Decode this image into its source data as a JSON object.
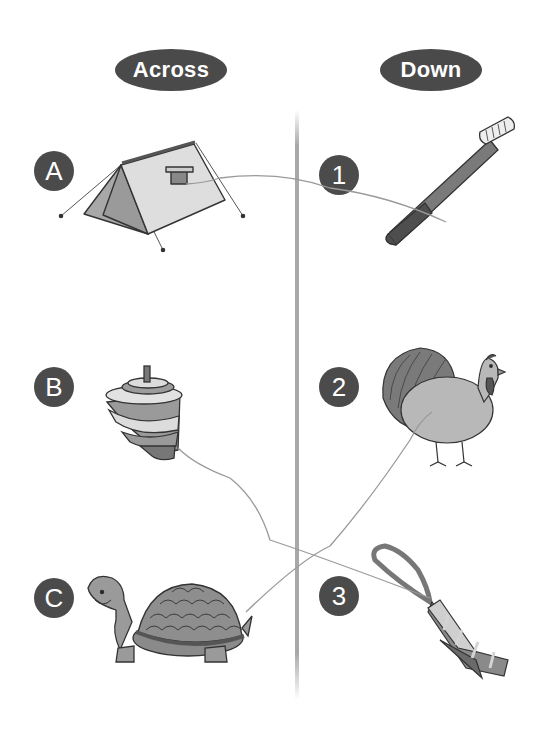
{
  "headers": {
    "across": "Across",
    "down": "Down"
  },
  "across_items": [
    {
      "label": "A",
      "picture": "tent"
    },
    {
      "label": "B",
      "picture": "spinning top"
    },
    {
      "label": "C",
      "picture": "turtle"
    }
  ],
  "down_items": [
    {
      "label": "1",
      "picture": "toothbrush"
    },
    {
      "label": "2",
      "picture": "turkey"
    },
    {
      "label": "3",
      "picture": "necktie"
    }
  ],
  "connections": [
    {
      "from": "A",
      "to": "1"
    },
    {
      "from": "B",
      "to": "3"
    },
    {
      "from": "C",
      "to": "2"
    }
  ],
  "colors": {
    "badge": "#4b4b4b",
    "pill": "#4a4a4a",
    "divider": "#a8a8a8",
    "line": "#9a9a9a",
    "fill_mid": "#9c9c9c",
    "fill_light": "#d4d4d4",
    "fill_dark": "#5e5e5e"
  }
}
